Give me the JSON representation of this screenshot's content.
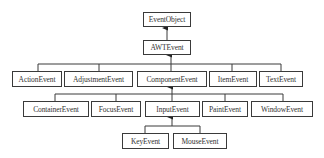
{
  "diagram": {
    "title": "",
    "nodes": [
      {
        "id": "eventobject",
        "label": "EventObject"
      },
      {
        "id": "awtevent",
        "label": "AWTEvent"
      },
      {
        "id": "actionevent",
        "label": "ActionEvent"
      },
      {
        "id": "adjustmentevent",
        "label": "AdjustmentEvent"
      },
      {
        "id": "componentevent",
        "label": "ComponentEvent"
      },
      {
        "id": "itemevent",
        "label": "ItemEvent"
      },
      {
        "id": "textevent",
        "label": "TextEvent"
      },
      {
        "id": "containerevent",
        "label": "ContainerEvent"
      },
      {
        "id": "focusevent",
        "label": "FocusEvent"
      },
      {
        "id": "inputevent",
        "label": "InputEvent"
      },
      {
        "id": "paintevent",
        "label": "PaintEvent"
      },
      {
        "id": "windowevent",
        "label": "WindowEvent"
      },
      {
        "id": "keyevent",
        "label": "KeyEvent"
      },
      {
        "id": "mouseevent",
        "label": "MouseEvent"
      }
    ],
    "edges": [
      {
        "from": "awtevent",
        "to": "eventobject"
      },
      {
        "from": "actionevent",
        "to": "awtevent"
      },
      {
        "from": "adjustmentevent",
        "to": "awtevent"
      },
      {
        "from": "componentevent",
        "to": "awtevent"
      },
      {
        "from": "itemevent",
        "to": "awtevent"
      },
      {
        "from": "textevent",
        "to": "awtevent"
      },
      {
        "from": "containerevent",
        "to": "componentevent"
      },
      {
        "from": "focusevent",
        "to": "componentevent"
      },
      {
        "from": "inputevent",
        "to": "componentevent"
      },
      {
        "from": "paintevent",
        "to": "componentevent"
      },
      {
        "from": "windowevent",
        "to": "componentevent"
      },
      {
        "from": "keyevent",
        "to": "inputevent"
      },
      {
        "from": "mouseevent",
        "to": "inputevent"
      }
    ]
  }
}
